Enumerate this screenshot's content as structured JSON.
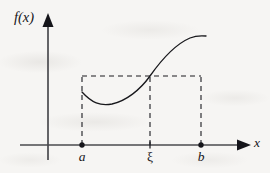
{
  "figure": {
    "kind": "function-graph-diagram",
    "background_color": "#f6f5f3",
    "ink_color": "#16161a",
    "width": 270,
    "height": 173
  },
  "axes": {
    "y_axis": {
      "label": "f(x)",
      "x_px": 48,
      "top_px": 14,
      "bottom_px": 160,
      "arrow": "up"
    },
    "x_axis": {
      "label": "x",
      "y_px": 145,
      "left_px": 20,
      "right_px": 250,
      "arrow": "right"
    }
  },
  "ticks": [
    {
      "name": "a",
      "label": "a",
      "x_px": 82,
      "italic": true,
      "marker": "filled-dot"
    },
    {
      "name": "xi",
      "label": "ξ",
      "x_px": 150,
      "italic": false,
      "marker": "small-tick"
    },
    {
      "name": "b",
      "label": "b",
      "x_px": 201,
      "italic": true,
      "marker": "filled-dot"
    }
  ],
  "dashed_rectangle": {
    "left_px": 82,
    "right_px": 201,
    "top_px": 76,
    "bottom_px": 145,
    "dash_pattern": "5,4"
  },
  "dashed_vertical_at_xi": {
    "x_px": 150,
    "top_px": 76,
    "bottom_px": 145,
    "dash_pattern": "5,4"
  },
  "curve": {
    "description": "increasing S-shaped curve f(x) dipping to a minimum after a then rising through the point at xi on the rectangle top and flattening near b",
    "path": "M 82 92 C 92 103, 100 106, 112 104 C 126 101, 140 90, 150 76 C 162 59, 176 44, 190 38 C 196 35.5, 201 35.5, 206 36",
    "stroke_width": 1.3,
    "points": [
      {
        "name": "start-at-a",
        "x_px": 82,
        "y_px": 92
      },
      {
        "name": "minimum",
        "x_px": 112,
        "y_px": 104
      },
      {
        "name": "crossing-at-xi",
        "x_px": 150,
        "y_px": 76
      },
      {
        "name": "end-near-b",
        "x_px": 206,
        "y_px": 36
      }
    ]
  }
}
